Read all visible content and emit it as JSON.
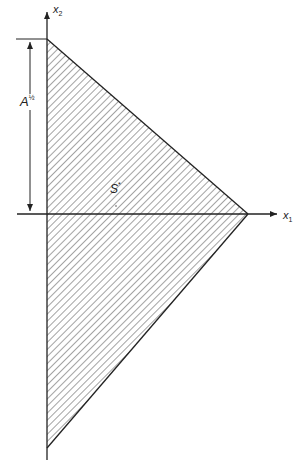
{
  "diagram": {
    "axes": {
      "x_label": "x",
      "x_sub": "1",
      "y_label": "x",
      "y_sub": "2"
    },
    "dimension_label": "A",
    "dimension_exponent": "½",
    "region_label": "S",
    "region_superscript": "*",
    "colors": {
      "line": "#222222",
      "hatch": "#555555",
      "background": "#ffffff"
    }
  }
}
